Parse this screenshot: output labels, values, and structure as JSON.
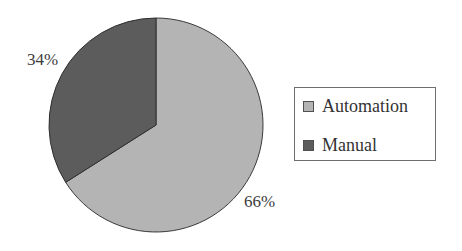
{
  "chart_data": {
    "type": "pie",
    "title": "",
    "categories": [
      "Automation",
      "Manual"
    ],
    "values": [
      66,
      34
    ],
    "unit": "%",
    "colors": {
      "Automation": "#b4b4b4",
      "Manual": "#5c5c5c"
    },
    "data_labels": {
      "Automation": "66%",
      "Manual": "34%"
    },
    "start_angle": "12 o'clock",
    "direction": "Manual counter-clockwise from top, Automation clockwise from top",
    "legend": {
      "position": "right",
      "entries": [
        "Automation",
        "Manual"
      ]
    }
  },
  "labels": {
    "manual_pct": "34%",
    "automation_pct": "66%"
  },
  "legend": {
    "items": [
      {
        "label": "Automation",
        "color": "#b4b4b4"
      },
      {
        "label": "Manual",
        "color": "#5c5c5c"
      }
    ]
  },
  "geometry": {
    "cx": 156,
    "cy": 125,
    "r": 107
  }
}
